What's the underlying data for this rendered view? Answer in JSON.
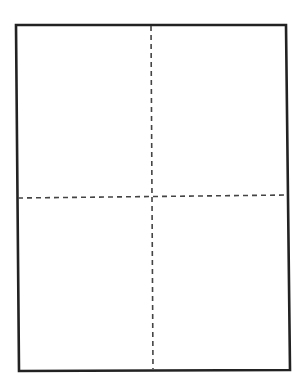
{
  "diagram": {
    "title": "Rectangle divided into four quadrants by dashed lines",
    "canvas": {
      "width": 301,
      "height": 391,
      "background": "#ffffff"
    },
    "frame": {
      "stroke": "#222222",
      "stroke_width": 2.6,
      "corners": {
        "top_left": [
          16,
          25
        ],
        "top_right": [
          286,
          25
        ],
        "bottom_right": [
          290,
          370
        ],
        "bottom_left": [
          19,
          371
        ]
      },
      "points": "16,25 286,25 290,370 19,371"
    },
    "dividers": {
      "stroke": "#444444",
      "stroke_width": 1.6,
      "dash": "5,4",
      "vertical": {
        "x1": 151,
        "y1": 26,
        "x2": 153,
        "y2": 369
      },
      "horizontal": {
        "x1": 18,
        "y1": 198,
        "x2": 287,
        "y2": 195
      }
    },
    "quadrants": [
      {
        "id": "top-left"
      },
      {
        "id": "top-right"
      },
      {
        "id": "bottom-left"
      },
      {
        "id": "bottom-right"
      }
    ]
  }
}
